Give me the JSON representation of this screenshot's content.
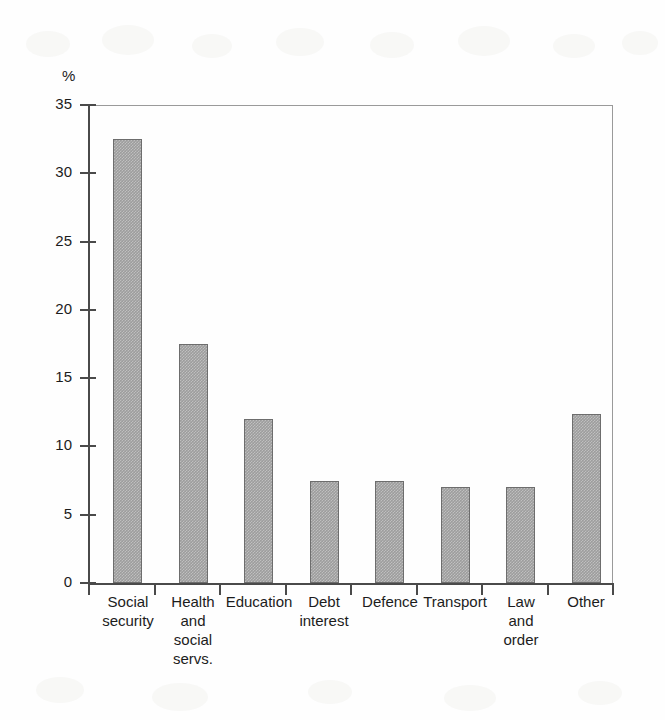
{
  "chart_data": {
    "type": "bar",
    "title": "",
    "subtitle": "",
    "xlabel": "",
    "ylabel": "%",
    "unit_label": "%",
    "ylim": [
      0,
      35
    ],
    "ytick_step": 5,
    "yticks": [
      "0",
      "5",
      "10",
      "15",
      "20",
      "25",
      "30",
      "35"
    ],
    "grid": false,
    "legend": false,
    "legend_position": "none",
    "annotations": [],
    "bar_color": "#9d9d9d",
    "bar_border_color": "#6d6d6d",
    "axis_color": "#4a4a4a",
    "frame_color": "#9a9a9a",
    "categories": [
      "Social security",
      "Health and social servs.",
      "Education",
      "Debt interest",
      "Defence",
      "Transport",
      "Law and order",
      "Other"
    ],
    "category_label_lines": [
      [
        "Social",
        "security"
      ],
      [
        "Health",
        "and",
        "social",
        "servs."
      ],
      [
        "Education"
      ],
      [
        "Debt",
        "interest"
      ],
      [
        "Defence"
      ],
      [
        "Transport"
      ],
      [
        "Law",
        "and",
        "order"
      ],
      [
        "Other"
      ]
    ],
    "values": [
      32.5,
      17.5,
      12.0,
      7.5,
      7.5,
      7.0,
      7.0,
      12.4
    ]
  }
}
